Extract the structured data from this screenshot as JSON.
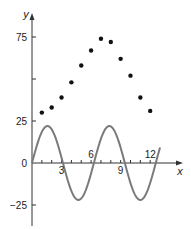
{
  "chart_data": {
    "type": "scatter",
    "title": "",
    "xlabel": "x",
    "ylabel": "y",
    "xlim": [
      0,
      14.5
    ],
    "ylim": [
      -37,
      88
    ],
    "x_ticks": [
      1,
      2,
      3,
      4,
      5,
      6,
      7,
      8,
      9,
      10,
      11,
      12
    ],
    "x_tick_labels": [
      {
        "value": 3,
        "label": "3",
        "position": "below"
      },
      {
        "value": 6,
        "label": "6",
        "position": "above"
      },
      {
        "value": 9,
        "label": "9",
        "position": "below"
      },
      {
        "value": 12,
        "label": "12",
        "position": "above"
      }
    ],
    "y_ticks": [
      75,
      50,
      25,
      0,
      -25
    ],
    "y_tick_labels": [
      {
        "value": 75,
        "label": "75"
      },
      {
        "value": 25,
        "label": "25"
      },
      {
        "value": 0,
        "label": "0"
      },
      {
        "value": -25,
        "label": "-25"
      }
    ],
    "grid": false,
    "legend": null,
    "series": [
      {
        "name": "data points",
        "kind": "scatter",
        "color": "#111111",
        "x": [
          1,
          2,
          3,
          4,
          5,
          6,
          7,
          8,
          9,
          10,
          11,
          12
        ],
        "y": [
          30,
          33,
          39,
          48,
          58,
          67,
          74,
          72,
          62,
          52,
          39,
          31
        ]
      },
      {
        "name": "sine curve",
        "kind": "line",
        "color": "#7a7a7a",
        "function": "22*sin(x)",
        "amplitude": 22,
        "period": 6.283,
        "x_range": [
          0,
          13
        ]
      }
    ]
  }
}
